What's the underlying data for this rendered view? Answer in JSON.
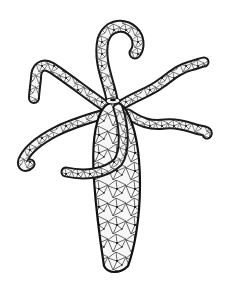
{
  "image": {
    "subject": "hydra illustration",
    "style": "black ink line drawing with net/mesh texture on white background",
    "colors": {
      "background": "#ffffff",
      "ink": "#1a1a1a",
      "fill": "#f4f4f4"
    },
    "parts": [
      "body-column",
      "hypostome",
      "tentacle-top",
      "tentacle-left",
      "tentacle-right-upper",
      "tentacle-right-lower",
      "tentacle-left-lower",
      "tentacle-front-curl"
    ]
  }
}
